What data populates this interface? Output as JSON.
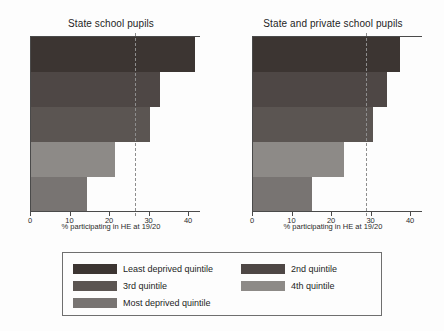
{
  "chart_data": {
    "type": "bar",
    "orientation": "horizontal",
    "title": "",
    "xlabel": "% participating in HE at 19/20",
    "ylabel": "",
    "xlim": [
      0,
      43
    ],
    "xticks": [
      0,
      10,
      20,
      30,
      40
    ],
    "grid": false,
    "legend_position": "bottom",
    "categories": [
      "Least deprived quintile",
      "2nd quintile",
      "3rd quintile",
      "4th quintile",
      "Most deprived quintile"
    ],
    "colors": [
      "#3c3532",
      "#4e4745",
      "#5b5552",
      "#8d8a87",
      "#787472"
    ],
    "panels": [
      {
        "title": "State school pupils",
        "values": [
          41.5,
          32.7,
          30.0,
          21.2,
          14.2
        ],
        "reference_line": 26.3,
        "reference_line_label": ""
      },
      {
        "title": "State and private school pupils",
        "values": [
          37.3,
          33.8,
          30.3,
          23.0,
          14.8
        ],
        "reference_line": 28.5,
        "reference_line_label": ""
      }
    ],
    "legend_entries": [
      {
        "label": "Least deprived quintile",
        "color": "#3c3532"
      },
      {
        "label": "2nd quintile",
        "color": "#4e4745"
      },
      {
        "label": "3rd quintile",
        "color": "#5b5552"
      },
      {
        "label": "4th quintile",
        "color": "#8d8a87"
      },
      {
        "label": "Most deprived quintile",
        "color": "#787472"
      }
    ]
  },
  "axis": {
    "tick_labels": [
      "0",
      "10",
      "20",
      "30",
      "40"
    ],
    "x_axis_title": "% participating in HE at 19/20"
  },
  "panel_left": {
    "title": "State school pupils"
  },
  "panel_right": {
    "title": "State and private school pupils"
  },
  "legend": {
    "items": [
      {
        "label": "Least deprived quintile"
      },
      {
        "label": "2nd quintile"
      },
      {
        "label": "3rd quintile"
      },
      {
        "label": "4th quintile"
      },
      {
        "label": "Most deprived quintile"
      }
    ]
  }
}
